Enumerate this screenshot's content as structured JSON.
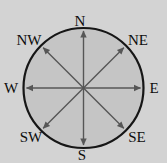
{
  "figure": {
    "kind": "compass-rose-diagram",
    "labels": {
      "n": "N",
      "ne": "NE",
      "e": "E",
      "se": "SE",
      "s": "S",
      "sw": "SW",
      "w": "W",
      "nw": "NW"
    },
    "colors": {
      "background": "#d3d3d3",
      "circle_fill": "#c5c5c5",
      "circle_stroke": "#161616",
      "arrow": "#565656",
      "label_text": "#0d0d0d"
    }
  }
}
